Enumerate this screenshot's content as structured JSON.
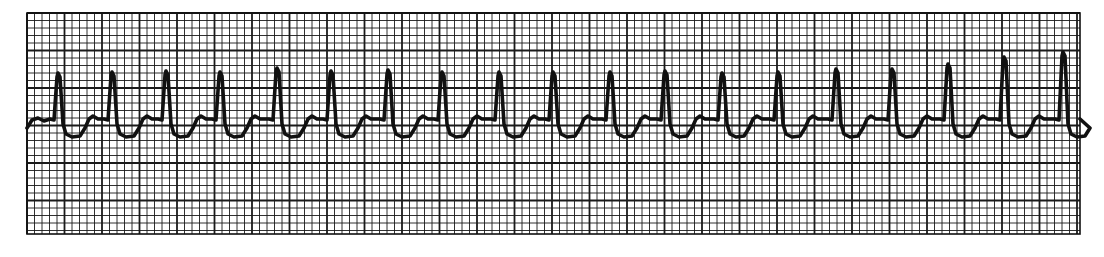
{
  "chart_data": {
    "type": "line",
    "title": "",
    "xlabel": "",
    "ylabel": "",
    "grid": true,
    "grid_small_px": 7.5,
    "grid_major_every": 5,
    "grid_bounds_px": {
      "left": 27,
      "top": 13,
      "right": 1080,
      "bottom": 234
    },
    "baseline_y_px": 118,
    "beats": [
      {
        "peak_x": 58,
        "peak_y": 73
      },
      {
        "peak_x": 112,
        "peak_y": 72
      },
      {
        "peak_x": 166,
        "peak_y": 71
      },
      {
        "peak_x": 220,
        "peak_y": 72
      },
      {
        "peak_x": 277,
        "peak_y": 68
      },
      {
        "peak_x": 331,
        "peak_y": 71
      },
      {
        "peak_x": 388,
        "peak_y": 70
      },
      {
        "peak_x": 442,
        "peak_y": 72
      },
      {
        "peak_x": 499,
        "peak_y": 72
      },
      {
        "peak_x": 553,
        "peak_y": 72
      },
      {
        "peak_x": 610,
        "peak_y": 72
      },
      {
        "peak_x": 665,
        "peak_y": 71
      },
      {
        "peak_x": 722,
        "peak_y": 73
      },
      {
        "peak_x": 778,
        "peak_y": 72
      },
      {
        "peak_x": 836,
        "peak_y": 69
      },
      {
        "peak_x": 892,
        "peak_y": 69
      },
      {
        "peak_x": 948,
        "peak_y": 64
      },
      {
        "peak_x": 1004,
        "peak_y": 57
      },
      {
        "peak_x": 1063,
        "peak_y": 52
      }
    ],
    "beat_count": 19,
    "colors": {
      "paper": "#ffffff",
      "grid": "#1a1a1a",
      "trace": "#111111"
    }
  }
}
